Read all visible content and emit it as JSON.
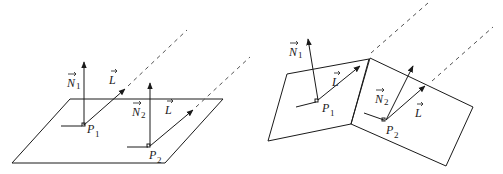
{
  "figure": {
    "left_panel": {
      "description": "flat plane with two points illuminated by a directional light",
      "labels": {
        "n1": "N",
        "n1_sub": "1",
        "l1": "L",
        "p1": "P",
        "p1_sub": "1",
        "n2": "N",
        "n2_sub": "2",
        "l2": "L",
        "p2": "P",
        "p2_sub": "2"
      }
    },
    "right_panel": {
      "description": "bent (two-facet) surface with two points illuminated by a directional light",
      "labels": {
        "n1": "N",
        "n1_sub": "1",
        "l1": "L",
        "p1": "P",
        "p1_sub": "1",
        "n2": "N",
        "n2_sub": "2",
        "l2": "L",
        "p2": "P",
        "p2_sub": "2"
      }
    }
  }
}
